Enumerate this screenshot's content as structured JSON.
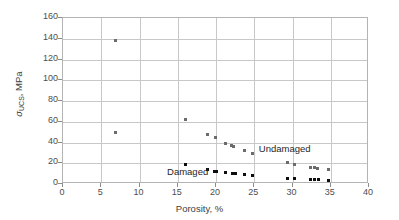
{
  "chart_data": {
    "type": "scatter",
    "title": "",
    "xlabel": "Porosity, %",
    "ylabel": "σUCS, MPa",
    "ylabel_symbol": "σ",
    "ylabel_subscript": "UCS",
    "ylabel_unit": ", MPa",
    "xlim": [
      0,
      40
    ],
    "ylim": [
      0,
      160
    ],
    "xticks": [
      0,
      5,
      10,
      15,
      20,
      25,
      30,
      35,
      40
    ],
    "yticks": [
      0,
      20,
      40,
      60,
      80,
      100,
      120,
      140,
      160
    ],
    "xtick_labels": [
      "0",
      "5",
      "10",
      "15",
      "20",
      "25",
      "30",
      "35",
      "40"
    ],
    "ytick_labels": [
      "0",
      "20",
      "40",
      "60",
      "80",
      "100",
      "120",
      "140",
      "160"
    ],
    "grid": "both",
    "legend": "none",
    "series": [
      {
        "name": "Undamaged",
        "color": "#6b6b6b",
        "marker": "square",
        "points": [
          [
            6.9,
            138
          ],
          [
            6.9,
            50
          ],
          [
            16.0,
            62
          ],
          [
            18.9,
            48
          ],
          [
            19.9,
            44.5
          ],
          [
            21.2,
            39.5
          ],
          [
            22.0,
            37
          ],
          [
            22.3,
            36
          ],
          [
            23.7,
            32.5
          ],
          [
            24.8,
            29
          ],
          [
            29.3,
            20.5
          ],
          [
            30.3,
            19
          ],
          [
            32.4,
            16
          ],
          [
            32.9,
            15.5
          ],
          [
            33.3,
            15
          ],
          [
            34.7,
            13.5
          ]
        ]
      },
      {
        "name": "Damaged",
        "color": "#0d0d0d",
        "marker": "square",
        "points": [
          [
            16.0,
            18.5
          ],
          [
            18.9,
            14
          ],
          [
            19.8,
            12.5
          ],
          [
            20.0,
            12
          ],
          [
            21.3,
            11
          ],
          [
            22.2,
            10.5
          ],
          [
            22.6,
            10.5
          ],
          [
            23.7,
            9
          ],
          [
            24.8,
            8
          ],
          [
            29.3,
            5.5
          ],
          [
            30.3,
            5.5
          ],
          [
            32.4,
            4
          ],
          [
            32.9,
            4
          ],
          [
            33.4,
            4
          ],
          [
            34.7,
            3.5
          ]
        ]
      }
    ],
    "annotations": [
      {
        "text": "Undamaged",
        "x": 25.6,
        "y": 33.5,
        "name": "undamaged-label"
      },
      {
        "text": "Damaged",
        "x": 13.6,
        "y": 11.5,
        "name": "damaged-label"
      }
    ]
  }
}
